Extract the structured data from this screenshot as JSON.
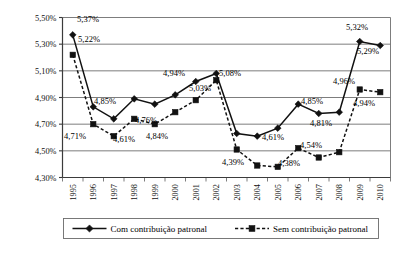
{
  "chart_data": {
    "type": "line",
    "title": "",
    "subtitle": "",
    "xlabel": "",
    "ylabel": "",
    "grid": true,
    "legend_position": "bottom",
    "ylim": [
      4.3,
      5.5
    ],
    "ytick_values": [
      4.3,
      4.5,
      4.7,
      4.9,
      5.1,
      5.3,
      5.5
    ],
    "ytick_labels": [
      "4,30%",
      "4,50%",
      "4,70%",
      "4,90%",
      "5,10%",
      "5,30%",
      "5,50%"
    ],
    "categories": [
      "1995",
      "1996",
      "1997",
      "1998",
      "1999",
      "2000",
      "2001",
      "2002",
      "2003",
      "2004",
      "2005",
      "2006",
      "2007",
      "2008",
      "2009",
      "2010"
    ],
    "series": [
      {
        "name": "Com contribuição patronal",
        "marker": "diamond",
        "line_style": "solid",
        "color": "#111111",
        "values": [
          5.37,
          4.83,
          4.74,
          4.89,
          4.85,
          4.92,
          5.02,
          5.08,
          4.63,
          4.61,
          4.67,
          4.85,
          4.78,
          4.79,
          5.32,
          5.29
        ]
      },
      {
        "name": "Sem contribuição patronal",
        "marker": "square",
        "line_style": "dashed",
        "color": "#111111",
        "values": [
          5.22,
          4.7,
          4.61,
          4.74,
          4.7,
          4.79,
          4.88,
          5.03,
          4.51,
          4.39,
          4.38,
          4.52,
          4.45,
          4.49,
          4.96,
          4.94
        ]
      }
    ],
    "annotations": [
      {
        "text": "5,37%",
        "series": 0,
        "category": "1995",
        "value": 5.37,
        "x": 77,
        "y": 22
      },
      {
        "text": "5,22%",
        "series": 1,
        "category": "1995",
        "value": 5.22,
        "x": 78,
        "y": 42
      },
      {
        "text": "4,85%",
        "series": 0,
        "category": "1997",
        "value": 4.85,
        "x": 94,
        "y": 104
      },
      {
        "text": "4,71%",
        "series": 1,
        "category": "1996",
        "value": 4.7,
        "x": 64,
        "y": 139
      },
      {
        "text": "4,61%",
        "series": 1,
        "category": "1997",
        "value": 4.61,
        "x": 113,
        "y": 142
      },
      {
        "text": "4,76%",
        "series": 1,
        "category": "1998",
        "value": 4.74,
        "x": 135,
        "y": 123
      },
      {
        "text": "4,84%",
        "series": 1,
        "category": "1999",
        "value": 4.7,
        "x": 146,
        "y": 139
      },
      {
        "text": "4,94%",
        "series": 0,
        "category": "2000",
        "value": 4.92,
        "x": 163,
        "y": 76
      },
      {
        "text": "5,03%",
        "series": 1,
        "category": "2002",
        "value": 5.03,
        "x": 189,
        "y": 91
      },
      {
        "text": "5,08%",
        "series": 0,
        "category": "2002",
        "value": 5.08,
        "x": 219,
        "y": 76
      },
      {
        "text": "4,39%",
        "series": 1,
        "category": "2004",
        "value": 4.39,
        "x": 222,
        "y": 165
      },
      {
        "text": "4,61%",
        "series": 0,
        "category": "2004",
        "value": 4.61,
        "x": 262,
        "y": 140
      },
      {
        "text": "4,38%",
        "series": 1,
        "category": "2005",
        "value": 4.38,
        "x": 278,
        "y": 166
      },
      {
        "text": "4,54%",
        "series": 0,
        "category": "2006",
        "value": 4.52,
        "x": 300,
        "y": 148
      },
      {
        "text": "4,85%",
        "series": 0,
        "category": "2006",
        "value": 4.85,
        "x": 301,
        "y": 104
      },
      {
        "text": "4,81%",
        "series": 0,
        "category": "2007",
        "value": 4.78,
        "x": 310,
        "y": 126
      },
      {
        "text": "4,96%",
        "series": 1,
        "category": "2009",
        "value": 4.96,
        "x": 333,
        "y": 84
      },
      {
        "text": "4,94%",
        "series": 1,
        "category": "2010",
        "value": 4.94,
        "x": 353,
        "y": 106
      },
      {
        "text": "5,32%",
        "series": 0,
        "category": "2009",
        "value": 5.32,
        "x": 346,
        "y": 30
      },
      {
        "text": "5,29%",
        "series": 0,
        "category": "2010",
        "value": 5.29,
        "x": 357,
        "y": 54
      }
    ],
    "legend": [
      {
        "label": "Com contribuição patronal",
        "marker": "diamond",
        "line_style": "solid"
      },
      {
        "label": "Sem contribuição patronal",
        "marker": "square",
        "line_style": "dashed"
      }
    ]
  }
}
